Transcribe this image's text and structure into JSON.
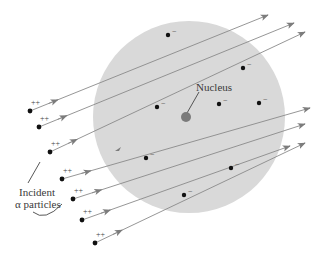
{
  "figure": {
    "labels": {
      "nucleus": "Nucleus",
      "incident_line1": "Incident",
      "incident_line2": "α particles"
    },
    "symbols": {
      "electron_charge": "−",
      "alpha_charge": "++"
    },
    "colors": {
      "atom_fill": "#d9d9d9",
      "nucleus_fill": "#7a7a7a",
      "track": "#8a8a8a",
      "arrowhead": "#7c7c7c",
      "electron": "#111111",
      "alpha": "#111111",
      "text": "#3a3a3a"
    },
    "atom": {
      "cx": 189,
      "cy": 117,
      "r": 96
    },
    "nucleus": {
      "cx": 186,
      "cy": 117,
      "r": 5
    },
    "electrons": [
      {
        "x": 168,
        "y": 35
      },
      {
        "x": 243,
        "y": 68
      },
      {
        "x": 157,
        "y": 107
      },
      {
        "x": 219,
        "y": 104
      },
      {
        "x": 259,
        "y": 103
      },
      {
        "x": 146,
        "y": 158
      },
      {
        "x": 231,
        "y": 168
      },
      {
        "x": 184,
        "y": 195
      }
    ],
    "alpha_particles": [
      {
        "x": 30,
        "y": 111,
        "ex": 268,
        "ey": 15
      },
      {
        "x": 39,
        "y": 127,
        "ex": 294,
        "ey": 23
      },
      {
        "x": 50,
        "y": 152,
        "ex": 305,
        "ey": 32
      },
      {
        "x": 62,
        "y": 179,
        "ex": 310,
        "ey": 108
      },
      {
        "x": 73,
        "y": 199,
        "ex": 305,
        "ey": 124
      },
      {
        "x": 82,
        "y": 220,
        "ex": 290,
        "ey": 146
      },
      {
        "x": 95,
        "y": 243,
        "ex": 305,
        "ey": 143
      }
    ]
  }
}
